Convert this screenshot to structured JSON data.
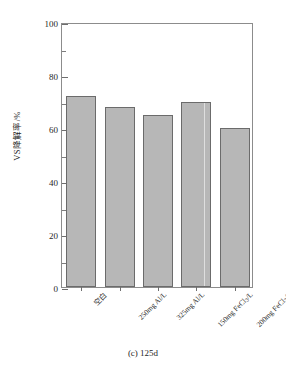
{
  "figure": {
    "caption": "(c) 125d",
    "y_axis_title": "VS降解率/%"
  },
  "chart_data": {
    "type": "bar",
    "title": "(c) 125d",
    "xlabel": "",
    "ylabel": "VS降解率/%",
    "ylim": [
      0,
      100
    ],
    "ytick_labels": [
      "0",
      "20",
      "40",
      "60",
      "80",
      "100"
    ],
    "ytick_values": [
      0,
      20,
      40,
      60,
      80,
      100
    ],
    "yminor_values": [
      10,
      30,
      50,
      70,
      90
    ],
    "grid": false,
    "legend": null,
    "categories": [
      "空白",
      "250mg Al/L",
      "325mg Al/L",
      "150mg FeCl₃/L",
      "200mg FeCl₃/L"
    ],
    "values": [
      72,
      68,
      65,
      70,
      60
    ],
    "bar_color": "#b7b7b7",
    "bar_edge_color": "#6b6b6b"
  },
  "categories_html": [
    "空白",
    "250mg Al/L",
    "325mg Al/L",
    "150mg FeCl<sub>3</sub>/L",
    "200mg FeCl<sub>3</sub>/L"
  ]
}
